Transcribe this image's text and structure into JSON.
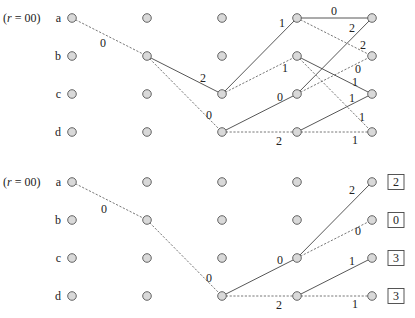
{
  "panels": [
    {
      "id": "top",
      "start_label": "(r = 00)",
      "row_labels": [
        "a",
        "b",
        "c",
        "d"
      ],
      "columns_x": [
        72,
        147,
        222,
        297,
        372
      ],
      "rows_y": [
        18,
        56,
        94,
        132
      ],
      "edges": [
        {
          "from": [
            0,
            0
          ],
          "to": [
            1,
            1
          ],
          "style": "dash",
          "label": "0",
          "lx": 103,
          "ly": 47
        },
        {
          "from": [
            1,
            1
          ],
          "to": [
            2,
            2
          ],
          "style": "solid",
          "label": "2",
          "lx": 203,
          "ly": 82
        },
        {
          "from": [
            1,
            1
          ],
          "to": [
            2,
            3
          ],
          "style": "dash",
          "label": "0",
          "lx": 209,
          "ly": 119
        },
        {
          "from": [
            2,
            2
          ],
          "to": [
            3,
            0
          ],
          "style": "solid",
          "label": "1",
          "lx": 282,
          "ly": 27
        },
        {
          "from": [
            2,
            2
          ],
          "to": [
            3,
            1
          ],
          "style": "dash",
          "label": "1",
          "lx": 285,
          "ly": 72
        },
        {
          "from": [
            2,
            3
          ],
          "to": [
            3,
            2
          ],
          "style": "solid",
          "label": "0",
          "lx": 280,
          "ly": 101
        },
        {
          "from": [
            2,
            3
          ],
          "to": [
            3,
            3
          ],
          "style": "dash",
          "label": "2",
          "lx": 279,
          "ly": 145
        },
        {
          "from": [
            3,
            0
          ],
          "to": [
            4,
            0
          ],
          "style": "solid",
          "label": "0",
          "lx": 334,
          "ly": 15
        },
        {
          "from": [
            3,
            0
          ],
          "to": [
            4,
            1
          ],
          "style": "dash",
          "label": "2",
          "lx": 363,
          "ly": 49
        },
        {
          "from": [
            3,
            2
          ],
          "to": [
            4,
            0
          ],
          "style": "solid",
          "label": "2",
          "lx": 352,
          "ly": 32
        },
        {
          "from": [
            3,
            2
          ],
          "to": [
            4,
            1
          ],
          "style": "dash",
          "label": "0",
          "lx": 358,
          "ly": 73
        },
        {
          "from": [
            3,
            1
          ],
          "to": [
            4,
            2
          ],
          "style": "solid",
          "label": "1",
          "lx": 355,
          "ly": 86
        },
        {
          "from": [
            3,
            1
          ],
          "to": [
            4,
            3
          ],
          "style": "dash",
          "label": "1",
          "lx": 362,
          "ly": 121
        },
        {
          "from": [
            3,
            3
          ],
          "to": [
            4,
            2
          ],
          "style": "solid",
          "label": "1",
          "lx": 352,
          "ly": 102
        },
        {
          "from": [
            3,
            3
          ],
          "to": [
            4,
            3
          ],
          "style": "dash",
          "label": "1",
          "lx": 355,
          "ly": 144
        }
      ]
    },
    {
      "id": "bottom",
      "start_label": "(r = 00)",
      "row_labels": [
        "a",
        "b",
        "c",
        "d"
      ],
      "columns_x": [
        72,
        147,
        222,
        297,
        372
      ],
      "rows_y": [
        182,
        220,
        258,
        296
      ],
      "edges": [
        {
          "from": [
            0,
            0
          ],
          "to": [
            1,
            1
          ],
          "style": "dash",
          "label": "0",
          "lx": 104,
          "ly": 213
        },
        {
          "from": [
            1,
            1
          ],
          "to": [
            2,
            3
          ],
          "style": "dash",
          "label": "0",
          "lx": 209,
          "ly": 282
        },
        {
          "from": [
            2,
            3
          ],
          "to": [
            3,
            2
          ],
          "style": "solid",
          "label": "0",
          "lx": 280,
          "ly": 264
        },
        {
          "from": [
            2,
            3
          ],
          "to": [
            3,
            3
          ],
          "style": "dash",
          "label": "2",
          "lx": 279,
          "ly": 309
        },
        {
          "from": [
            3,
            2
          ],
          "to": [
            4,
            0
          ],
          "style": "solid",
          "label": "2",
          "lx": 352,
          "ly": 194
        },
        {
          "from": [
            3,
            2
          ],
          "to": [
            4,
            1
          ],
          "style": "dash",
          "label": "0",
          "lx": 358,
          "ly": 235
        },
        {
          "from": [
            3,
            3
          ],
          "to": [
            4,
            2
          ],
          "style": "solid",
          "label": "1",
          "lx": 352,
          "ly": 265
        },
        {
          "from": [
            3,
            3
          ],
          "to": [
            4,
            3
          ],
          "style": "dash",
          "label": "1",
          "lx": 355,
          "ly": 308
        }
      ],
      "final_metrics": [
        "2",
        "0",
        "3",
        "3"
      ]
    }
  ]
}
